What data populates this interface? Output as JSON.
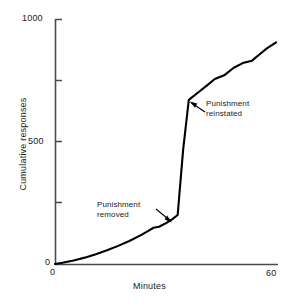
{
  "figure": {
    "background_color": "#ffffff",
    "line_color": "#000000"
  },
  "axes": {
    "x": {
      "title": "Minutes",
      "tick_labels": [
        "0",
        "60"
      ],
      "min": 0,
      "max": 60
    },
    "y": {
      "title": "Cumulative responses",
      "tick_labels": [
        "0",
        "500",
        "1000"
      ],
      "min": 0,
      "max": 1000
    }
  },
  "annotations": [
    {
      "name": "punishment-removed",
      "line1": "Punishment",
      "line2": "removed",
      "target_x": 33,
      "target_y": 200
    },
    {
      "name": "punishment-reinstated",
      "line1": "Punishment",
      "line2": "reinstated",
      "target_x": 36,
      "target_y": 670
    }
  ],
  "chart_data": {
    "type": "line",
    "title": "",
    "xlabel": "Minutes",
    "ylabel": "Cumulative responses",
    "xlim": [
      0,
      60
    ],
    "ylim": [
      0,
      1000
    ],
    "grid": false,
    "legend": false,
    "xticks": [
      0,
      60
    ],
    "yticks": [
      0,
      250,
      500,
      750,
      1000
    ],
    "ytick_labels": [
      "0",
      "",
      "500",
      "",
      "1000"
    ],
    "minor_ticks_unlabeled": [
      250,
      750
    ],
    "series": [
      {
        "name": "Cumulative responses",
        "x": [
          0,
          2,
          5,
          8,
          11,
          14,
          17,
          20,
          23,
          25,
          26.5,
          28,
          30,
          31.5,
          33,
          33.5,
          34.5,
          36,
          38.5,
          41,
          43,
          45.5,
          48,
          50.5,
          53,
          55,
          57,
          59.5
        ],
        "y": [
          0,
          5,
          14,
          26,
          40,
          56,
          74,
          94,
          117,
          134,
          148,
          152,
          168,
          182,
          200,
          290,
          470,
          670,
          700,
          730,
          755,
          770,
          800,
          820,
          830,
          855,
          880,
          905
        ]
      }
    ],
    "annotations": [
      {
        "text": "Punishment removed",
        "x": 33,
        "y": 200
      },
      {
        "text": "Punishment reinstated",
        "x": 36,
        "y": 670
      }
    ]
  }
}
